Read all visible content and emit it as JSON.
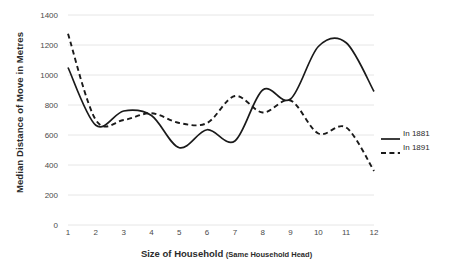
{
  "chart_data": {
    "type": "line",
    "title": "",
    "xlabel": "Size of Household",
    "xlabel_sub": "(Same Household Head)",
    "ylabel": "Median Distance of Move in Metres",
    "x": [
      1,
      2,
      3,
      4,
      5,
      6,
      7,
      8,
      9,
      10,
      11,
      12
    ],
    "categories": [
      "1",
      "2",
      "3",
      "4",
      "5",
      "6",
      "7",
      "8",
      "9",
      "10",
      "11",
      "12"
    ],
    "xlim": [
      1,
      12
    ],
    "ylim": [
      0,
      1400
    ],
    "yticks": [
      0,
      200,
      400,
      600,
      800,
      1000,
      1200,
      1400
    ],
    "ytick_labels": [
      "0",
      "200",
      "400",
      "600",
      "800",
      "1000",
      "1200",
      "1400"
    ],
    "grid": "horizontal",
    "smoothing": "spline",
    "legend_position": "right",
    "series": [
      {
        "name": "In 1881",
        "style": "solid",
        "color": "#1a1a1a",
        "values": [
          1050,
          665,
          760,
          730,
          515,
          635,
          560,
          900,
          840,
          1190,
          1215,
          890
        ]
      },
      {
        "name": "In 1891",
        "style": "dashed",
        "color": "#1a1a1a",
        "values": [
          1275,
          700,
          700,
          745,
          680,
          680,
          860,
          750,
          830,
          610,
          650,
          360
        ]
      }
    ]
  },
  "legend": {
    "items": [
      {
        "label": "In 1881",
        "style": "solid"
      },
      {
        "label": "In 1891",
        "style": "dashed"
      }
    ]
  },
  "colors": {
    "gridline": "#e6e6e6",
    "line": "#1a1a1a",
    "text": "#2b2b2b",
    "tick_text": "#4a4a4a",
    "background": "#ffffff"
  }
}
